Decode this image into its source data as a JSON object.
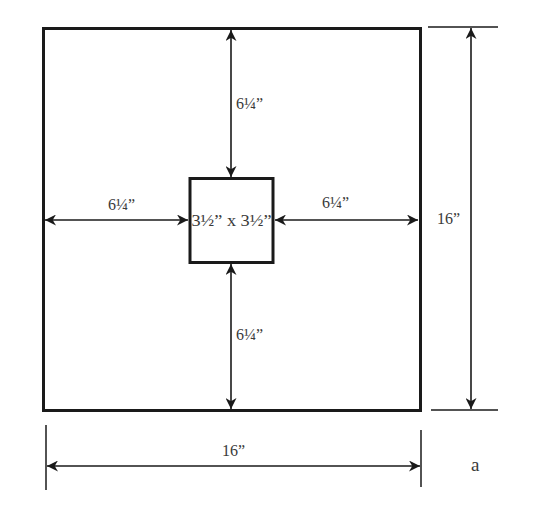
{
  "diagram": {
    "type": "dimensioned-drawing",
    "outer_square": {
      "width_label": "16”",
      "height_label": "16”"
    },
    "inner_square": {
      "label": "3½” x 3½”"
    },
    "margins": {
      "top": "6¼”",
      "bottom": "6¼”",
      "left": "6¼”",
      "right": "6¼”"
    },
    "figure_label": "a"
  },
  "colors": {
    "stroke": "#1a1a1a",
    "text": "#3a3a3a",
    "background": "#ffffff"
  }
}
